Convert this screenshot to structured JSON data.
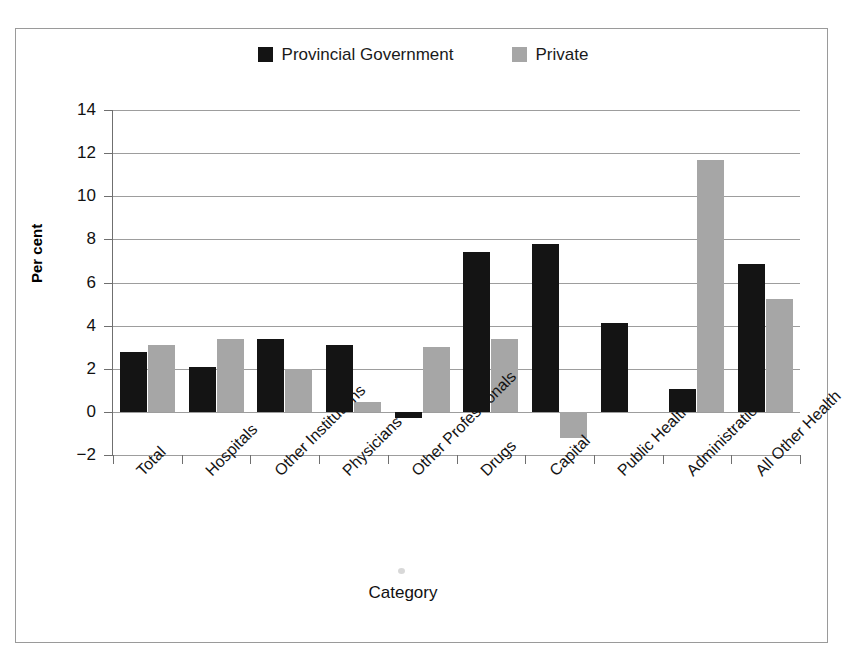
{
  "chart_data": {
    "type": "bar",
    "title": "",
    "xlabel": "Category",
    "ylabel": "Per cent",
    "ylim": [
      -2,
      14
    ],
    "yticks": [
      -2,
      0,
      2,
      4,
      6,
      8,
      10,
      12,
      14
    ],
    "ytick_labels": [
      "−2",
      "0",
      "2",
      "4",
      "6",
      "8",
      "10",
      "12",
      "14"
    ],
    "grid": true,
    "legend_position": "top-center",
    "categories": [
      "Total",
      "Hospitals",
      "Other Institutions",
      "Physicians",
      "Other Professionals",
      "Drugs",
      "Capital",
      "Public Health",
      "Administration",
      "All Other Health"
    ],
    "series": [
      {
        "name": "Provincial Government",
        "color": "#141414",
        "values": [
          2.8,
          2.1,
          3.4,
          3.1,
          -0.3,
          7.4,
          7.8,
          4.1,
          1.05,
          6.85
        ]
      },
      {
        "name": "Private",
        "color": "#a6a6a6",
        "values": [
          3.1,
          3.4,
          2.0,
          0.45,
          3.0,
          3.4,
          -1.2,
          0,
          11.7,
          5.25
        ]
      }
    ]
  },
  "legend": {
    "items": [
      {
        "label": "Provincial Government",
        "color": "#141414",
        "swatch": "legend-swatch-black"
      },
      {
        "label": "Private",
        "color": "#a6a6a6",
        "swatch": "legend-swatch-gray"
      }
    ]
  },
  "axes": {
    "y_title": "Per cent",
    "x_title": "Category"
  }
}
